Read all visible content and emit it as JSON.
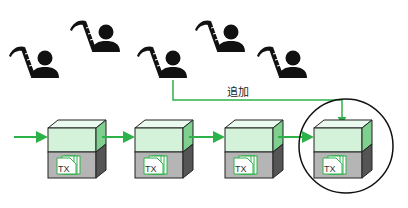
{
  "diagram": {
    "title": "",
    "add_label": "追加",
    "block_label": "TX",
    "colors": {
      "green": "#2db24a",
      "block_front": "#d4f2d9",
      "block_top": "#eafaee",
      "block_side": "#7fcf8e",
      "bottom_front": "#b5b5b5",
      "bottom_side": "#555555",
      "person": "#111111"
    },
    "miners": [
      {
        "id": 1,
        "x": 45,
        "y": 63
      },
      {
        "id": 2,
        "x": 106,
        "y": 40
      },
      {
        "id": 3,
        "x": 173,
        "y": 63
      },
      {
        "id": 4,
        "x": 231,
        "y": 40
      },
      {
        "id": 5,
        "x": 293,
        "y": 63
      }
    ],
    "blocks": [
      {
        "id": 1,
        "x": 48,
        "label": "TX"
      },
      {
        "id": 2,
        "x": 135,
        "label": "TX"
      },
      {
        "id": 3,
        "x": 225,
        "label": "TX"
      },
      {
        "id": 4,
        "x": 314,
        "label": "TX",
        "highlighted": true
      }
    ]
  }
}
